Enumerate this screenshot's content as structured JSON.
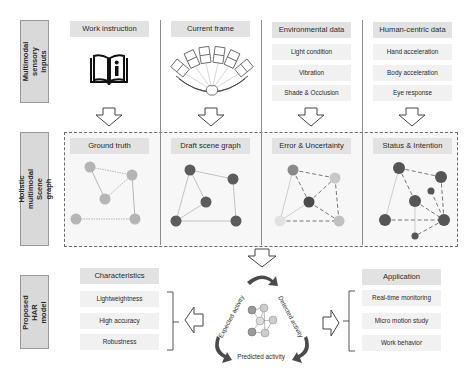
{
  "rows": {
    "inputs_label": "Multimodal sensory inputs",
    "scene_graph_label": "Holistic multimodal Scene graph",
    "har_label": "Proposed HAR model"
  },
  "inputs": {
    "work_instruction": {
      "title": "Work instruction",
      "icon": "book-info-icon"
    },
    "current_frame": {
      "title": "Current frame",
      "icon": "multi-camera-array-icon"
    },
    "environmental": {
      "title": "Environmental data",
      "items": [
        "Light condition",
        "Vibration",
        "Shade & Occlusion"
      ]
    },
    "human_centric": {
      "title": "Human-centric data",
      "items": [
        "Hand acceleration",
        "Body acceleration",
        "Eye response"
      ]
    }
  },
  "scene_graphs": [
    {
      "title": "Ground truth",
      "node_color": "#b5b5b5"
    },
    {
      "title": "Draft scene graph",
      "node_color": "#5c5c5c"
    },
    {
      "title": "Error & Uncertainty",
      "node_color": "#8a8a8a"
    },
    {
      "title": "Status & Intention",
      "node_color": "#555555"
    }
  ],
  "har": {
    "cycle": {
      "expected": "Expected activity",
      "detected": "Detected activity",
      "predicted": "Predicted activity"
    },
    "characteristics": {
      "title": "Characteristics",
      "items": [
        "Lightweightness",
        "High accuracy",
        "Robustness"
      ]
    },
    "application": {
      "title": "Application",
      "items": [
        "Real-time monitoring",
        "Micro motion study",
        "Work behavior"
      ]
    }
  },
  "colors": {
    "header_bg": "#e2e2e2",
    "item_bg": "#f1f1f1",
    "label_bg": "#d9d9d9",
    "dark_node": "#5c5c5c",
    "light_node": "#b5b5b5",
    "arrow_dark": "#4a4a4a"
  }
}
